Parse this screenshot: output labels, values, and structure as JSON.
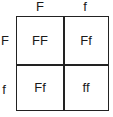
{
  "punnett": {
    "top_alleles": [
      "F",
      "f"
    ],
    "side_alleles": [
      "F",
      "f"
    ],
    "cells": [
      [
        "FF",
        "Ff"
      ],
      [
        "Ff",
        "ff"
      ]
    ]
  }
}
